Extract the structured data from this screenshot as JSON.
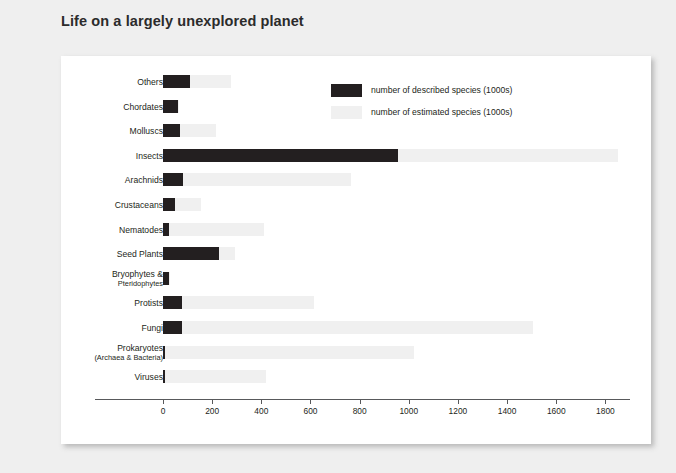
{
  "page": {
    "title": "Life on a largely unexplored planet",
    "background_color": "#efefef",
    "card_color": "#ffffff"
  },
  "legend": {
    "position": "top-right-inside",
    "items": [
      {
        "key": "described",
        "label": "number of described species (1000s)",
        "color": "#231f20"
      },
      {
        "key": "estimated",
        "label": "number of estimated species (1000s)",
        "color": "#f0f0f0"
      }
    ]
  },
  "axis": {
    "ticks": [
      "0",
      "200",
      "400",
      "600",
      "800",
      "1000",
      "1200",
      "1400",
      "1600",
      "1800"
    ]
  },
  "chart_data": {
    "type": "bar",
    "orientation": "horizontal",
    "title": "Life on a largely unexplored planet",
    "xlabel": "",
    "ylabel": "",
    "xlim": [
      0,
      1900
    ],
    "grid": false,
    "legend_position": "top-right-inside",
    "categories": [
      "Others",
      "Chordates",
      "Molluscs",
      "Insects",
      "Arachnids",
      "Crustaceans",
      "Nematodes",
      "Seed Plants",
      "Bryophytes & Pteridophytes",
      "Protists",
      "Fungi",
      "Prokaryotes (Archaea & Bacteria)",
      "Viruses"
    ],
    "category_labels": [
      {
        "main": "Others",
        "sub": ""
      },
      {
        "main": "Chordates",
        "sub": ""
      },
      {
        "main": "Molluscs",
        "sub": ""
      },
      {
        "main": "Insects",
        "sub": ""
      },
      {
        "main": "Arachnids",
        "sub": ""
      },
      {
        "main": "Crustaceans",
        "sub": ""
      },
      {
        "main": "Nematodes",
        "sub": ""
      },
      {
        "main": "Seed Plants",
        "sub": ""
      },
      {
        "main": "Bryophytes &",
        "sub": "Pteridophytes"
      },
      {
        "main": "Protists",
        "sub": ""
      },
      {
        "main": "Fungi",
        "sub": ""
      },
      {
        "main": "Prokaryotes",
        "sub": "(Archaea & Bacteria)"
      },
      {
        "main": "Viruses",
        "sub": ""
      }
    ],
    "series": [
      {
        "name": "number of described species (1000s)",
        "color": "#231f20",
        "values": [
          110,
          60,
          70,
          958,
          82,
          47,
          25,
          227,
          23,
          78,
          78,
          10,
          10
        ]
      },
      {
        "name": "number of estimated species (1000s)",
        "color": "#f0f0f0",
        "values": [
          278,
          65,
          215,
          1850,
          763,
          153,
          411,
          293,
          30,
          614,
          1506,
          1021,
          419
        ]
      }
    ]
  }
}
